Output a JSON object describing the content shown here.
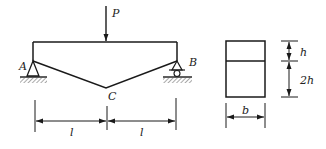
{
  "diagram": {
    "type": "structural-beam",
    "colors": {
      "stroke": "#1a1a1a",
      "background": "#ffffff",
      "hatch": "#555555"
    },
    "beam": {
      "load_label": "P",
      "support_left_label": "A",
      "support_right_label": "B",
      "bottom_point_label": "C",
      "support_left_type": "pin",
      "support_right_type": "roller"
    },
    "span_dimensions": [
      {
        "label": "l"
      },
      {
        "label": "l"
      }
    ],
    "cross_section": {
      "width_label": "b",
      "top_height_label": "h",
      "bottom_height_label": "2h"
    }
  }
}
